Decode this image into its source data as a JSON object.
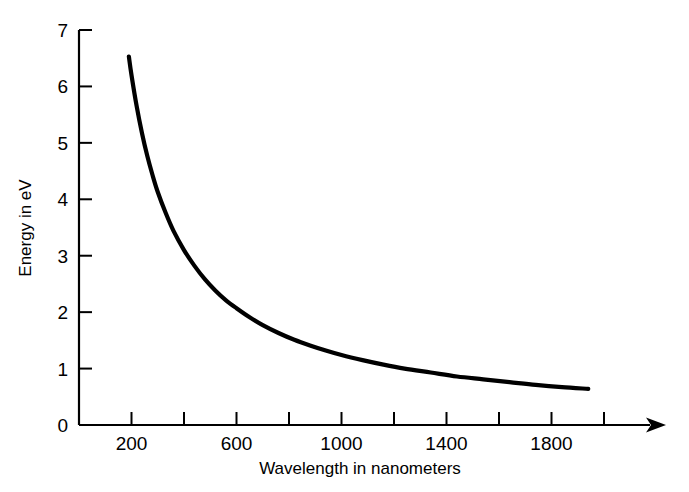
{
  "chart_data": {
    "type": "line",
    "title": "",
    "xlabel": "Wavelength in nanometers",
    "ylabel": "Energy in eV",
    "xlim": [
      0,
      2000
    ],
    "ylim": [
      0,
      7
    ],
    "grid": false,
    "legend": null,
    "relation": "E = 1240 / lambda",
    "x_ticks": [
      0,
      200,
      400,
      600,
      800,
      1000,
      1200,
      1400,
      1600,
      1800,
      2000
    ],
    "x_tick_labels": [
      "",
      "200",
      "",
      "600",
      "",
      "1000",
      "",
      "1400",
      "",
      "1800",
      ""
    ],
    "y_ticks": [
      0,
      1,
      2,
      3,
      4,
      5,
      6,
      7
    ],
    "y_tick_labels": [
      "0",
      "1",
      "2",
      "3",
      "4",
      "5",
      "6",
      "7"
    ],
    "x_axis_arrow": true,
    "series": [
      {
        "name": "photon energy",
        "color": "#000000",
        "x": [
          190,
          200,
          220,
          240,
          260,
          280,
          300,
          330,
          360,
          400,
          440,
          480,
          520,
          560,
          600,
          650,
          700,
          760,
          820,
          880,
          940,
          1000,
          1080,
          1160,
          1240,
          1340,
          1440,
          1540,
          1640,
          1740,
          1840,
          1940
        ],
        "y": [
          6.53,
          6.2,
          5.64,
          5.17,
          4.77,
          4.43,
          4.13,
          3.76,
          3.44,
          3.1,
          2.82,
          2.58,
          2.38,
          2.21,
          2.07,
          1.91,
          1.77,
          1.63,
          1.51,
          1.41,
          1.32,
          1.24,
          1.15,
          1.07,
          1.0,
          0.93,
          0.86,
          0.81,
          0.76,
          0.71,
          0.67,
          0.64
        ]
      }
    ]
  },
  "axes": {
    "y_title": "Energy in eV",
    "x_title": "Wavelength in nanometers"
  }
}
